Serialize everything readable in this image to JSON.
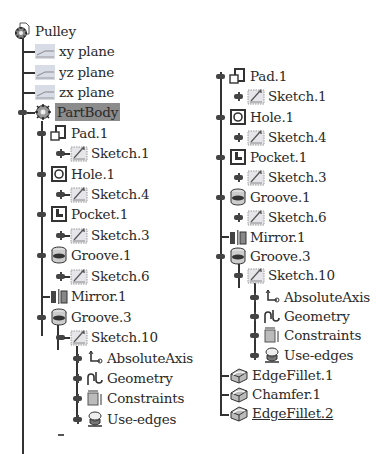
{
  "left_tree": {
    "root": {
      "label": "Pulley",
      "icon": "part-icon"
    },
    "planes": [
      {
        "label": "xy plane",
        "icon": "plane-icon"
      },
      {
        "label": "yz plane",
        "icon": "plane-icon"
      },
      {
        "label": "zx plane",
        "icon": "plane-icon"
      }
    ],
    "partbody": {
      "label": "PartBody",
      "icon": "body-icon",
      "selected": true
    },
    "features": [
      {
        "label": "Pad.1",
        "icon": "pad-icon",
        "child": {
          "label": "Sketch.1",
          "icon": "sketch-icon"
        }
      },
      {
        "label": "Hole.1",
        "icon": "hole-icon",
        "child": {
          "label": "Sketch.4",
          "icon": "sketch-icon"
        }
      },
      {
        "label": "Pocket.1",
        "icon": "pocket-icon",
        "child": {
          "label": "Sketch.3",
          "icon": "sketch-icon"
        }
      },
      {
        "label": "Groove.1",
        "icon": "groove-icon",
        "child": {
          "label": "Sketch.6",
          "icon": "sketch-icon"
        }
      },
      {
        "label": "Mirror.1",
        "icon": "mirror-icon"
      },
      {
        "label": "Groove.3",
        "icon": "groove-icon",
        "child": {
          "label": "Sketch.10",
          "icon": "sketch-icon",
          "children": [
            {
              "label": "AbsoluteAxis",
              "icon": "axis-icon"
            },
            {
              "label": "Geometry",
              "icon": "geometry-icon"
            },
            {
              "label": "Constraints",
              "icon": "constraints-icon"
            },
            {
              "label": "Use-edges",
              "icon": "use-edges-icon"
            }
          ]
        }
      }
    ]
  },
  "right_tree": {
    "features": [
      {
        "label": "Pad.1",
        "child": {
          "label": "Sketch.1"
        }
      },
      {
        "label": "Hole.1",
        "child": {
          "label": "Sketch.4"
        }
      },
      {
        "label": "Pocket.1",
        "child": {
          "label": "Sketch.3"
        }
      },
      {
        "label": "Groove.1",
        "child": {
          "label": "Sketch.6"
        }
      },
      {
        "label": "Mirror.1"
      },
      {
        "label": "Groove.3",
        "child": {
          "label": "Sketch.10",
          "children": [
            {
              "label": "AbsoluteAxis"
            },
            {
              "label": "Geometry"
            },
            {
              "label": "Constraints"
            },
            {
              "label": "Use-edges"
            }
          ]
        }
      },
      {
        "label": "EdgeFillet.1",
        "icon": "edge-fillet-icon"
      },
      {
        "label": "Chamfer.1",
        "icon": "chamfer-icon"
      },
      {
        "label": "EdgeFillet.2",
        "icon": "edge-fillet-icon",
        "underlined": true
      }
    ]
  },
  "colors": {
    "selection_bg": "#8c8c8c",
    "tree_line": "#333333",
    "text": "#2a2a2a"
  }
}
